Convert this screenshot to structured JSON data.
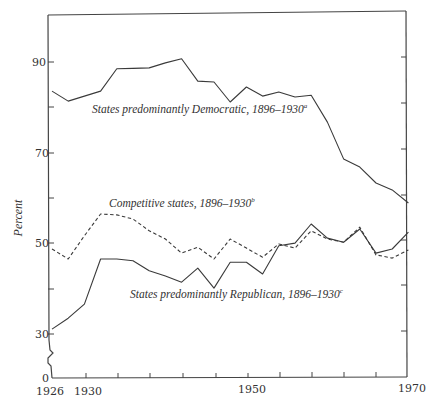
{
  "chart_data": {
    "type": "line",
    "title": "",
    "xlabel": "",
    "ylabel": "Percent",
    "ylim": [
      0,
      100
    ],
    "xlim": [
      1926,
      1970
    ],
    "grid": false,
    "legend_position": "inline annotations",
    "y_tick_labels": [
      "0",
      "30",
      "50",
      "70",
      "90"
    ],
    "y_ticks": [
      30,
      40,
      50,
      60,
      70,
      80,
      90
    ],
    "y_axis_break": "between 0 and 30",
    "x_tick_labels": [
      "1926",
      "1930",
      "1950",
      "1970"
    ],
    "x_ticks": [
      1930,
      1934,
      1938,
      1942,
      1946,
      1950,
      1954,
      1958,
      1962,
      1966,
      1970
    ],
    "x": [
      1926,
      1928,
      1930,
      1932,
      1934,
      1936,
      1938,
      1940,
      1942,
      1944,
      1946,
      1948,
      1950,
      1952,
      1954,
      1956,
      1958,
      1960,
      1962,
      1964,
      1966,
      1968,
      1970
    ],
    "series": [
      {
        "name": "States predominantly Democratic, 1896–1930",
        "label_main": "States predominantly Democratic, 1896–1930",
        "footnote": "a",
        "style": "solid",
        "values": [
          83.6,
          81.4,
          82.5,
          83.6,
          88.5,
          88.6,
          88.7,
          89.8,
          90.7,
          85.8,
          85.6,
          81.2,
          84.5,
          82.5,
          83.4,
          82.3,
          82.7,
          76.8,
          68.7,
          66.9,
          63.4,
          61.9,
          59.0
        ]
      },
      {
        "name": "Competitive states, 1896–1930",
        "label_main": "Competitive states, 1896–1930",
        "footnote": "b",
        "style": "dashed",
        "values": [
          48.9,
          46.7,
          51.8,
          56.6,
          56.4,
          55.5,
          52.9,
          51.1,
          48.0,
          49.3,
          46.7,
          51.1,
          49.1,
          47.1,
          50.0,
          49.1,
          52.9,
          51.1,
          50.4,
          53.7,
          47.6,
          46.9,
          48.7
        ]
      },
      {
        "name": "States predominantly Republican, 1896–1930",
        "label_main": "States predominantly Republican, 1896–1930",
        "footnote": "c",
        "style": "solid",
        "values": [
          31.3,
          33.7,
          36.8,
          46.7,
          46.7,
          46.3,
          44.1,
          43.0,
          41.6,
          44.7,
          40.3,
          46.0,
          46.0,
          43.4,
          49.6,
          50.2,
          54.4,
          51.3,
          50.4,
          53.3,
          48.0,
          48.9,
          52.6
        ]
      }
    ],
    "annotations": [
      {
        "series": 0,
        "x_px": 92,
        "y_px": 113
      },
      {
        "series": 1,
        "x_px": 109,
        "y_px": 207
      },
      {
        "series": 2,
        "x_px": 130,
        "y_px": 298
      }
    ]
  },
  "axes": {
    "y_title": "Percent",
    "y_labels": {
      "l0": "0",
      "l30": "30",
      "l50": "50",
      "l70": "70",
      "l90": "90"
    },
    "x_labels": {
      "l1926": "1926",
      "l1930": "1930",
      "l1950": "1950",
      "l1970": "1970"
    }
  },
  "labels": {
    "democratic": "States predominantly Democratic, 1896–1930",
    "democratic_note": "a",
    "competitive": "Competitive states, 1896–1930",
    "competitive_note": "b",
    "republican": "States predominantly Republican, 1896–1930",
    "republican_note": "c"
  },
  "colors": {
    "line": "#3a3a3a",
    "axis": "#444444",
    "background": "#ffffff"
  }
}
